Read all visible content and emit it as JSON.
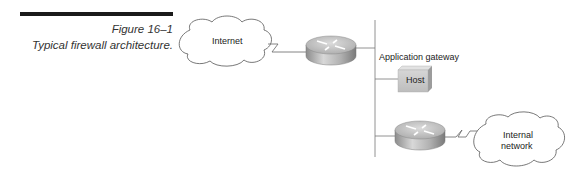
{
  "figure": {
    "number": "Figure 16–1",
    "title": "Typical firewall architecture."
  },
  "nodes": {
    "internet": {
      "label_line1": "Internet",
      "type": "cloud"
    },
    "router_outer": {
      "type": "router"
    },
    "app_gateway": {
      "label": "Application gateway"
    },
    "host": {
      "label": "Host",
      "type": "server-box"
    },
    "router_inner": {
      "type": "router"
    },
    "internal": {
      "label_line1": "Internal",
      "label_line2": "network",
      "type": "cloud"
    }
  },
  "colors": {
    "rule": "#1a1a1a",
    "line": "#888888",
    "host_fill": "#c8c8c8",
    "router_top": "#bdbdbd",
    "router_side": "#9a9a9a"
  }
}
